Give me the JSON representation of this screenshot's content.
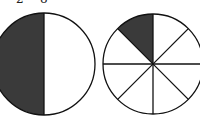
{
  "top_labels": [
    "2",
    "8"
  ],
  "figures": [
    {
      "name": "half-circle",
      "parts": 2,
      "shaded": 1,
      "fraction_label": "1/2"
    },
    {
      "name": "eighths-circle",
      "parts": 8,
      "shaded": 1,
      "fraction_label": "1/8"
    }
  ],
  "colors": {
    "shade": "#3a3a3a",
    "stroke": "#111111",
    "background": "#ffffff"
  }
}
